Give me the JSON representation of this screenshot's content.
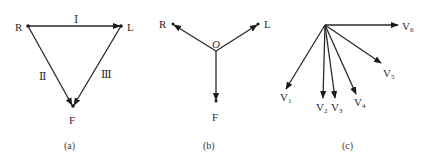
{
  "figure": {
    "panel_a": {
      "caption": "(a)",
      "vertices": {
        "R": "R",
        "L": "L",
        "F": "F"
      },
      "leads": {
        "I": "Ⅰ",
        "II": "Ⅱ",
        "III": "Ⅲ"
      }
    },
    "panel_b": {
      "caption": "(b)",
      "center": "O",
      "ends": {
        "R": "R",
        "L": "L",
        "F": "F"
      }
    },
    "panel_c": {
      "caption": "(c)",
      "vectors": [
        {
          "base": "V",
          "sub": "1"
        },
        {
          "base": "V",
          "sub": "2"
        },
        {
          "base": "V",
          "sub": "3"
        },
        {
          "base": "V",
          "sub": "4"
        },
        {
          "base": "V",
          "sub": "5"
        },
        {
          "base": "V",
          "sub": "6"
        }
      ]
    }
  }
}
